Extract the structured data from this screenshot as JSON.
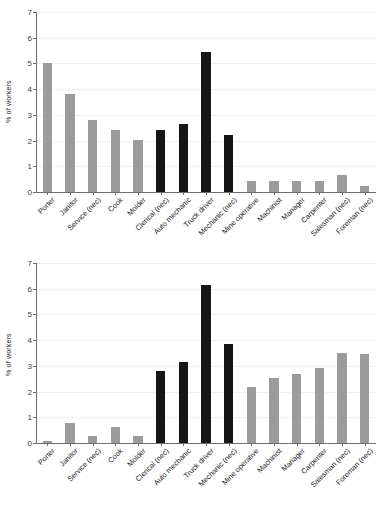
{
  "figure": {
    "background_color": "#ffffff",
    "bar_color_gray": "#9b9b9b",
    "bar_color_black": "#161616",
    "axis_color": "#6d6e71",
    "grid_color": "#f0f0f0"
  },
  "chart_data": [
    {
      "type": "bar",
      "title": "",
      "xlabel": "",
      "ylabel": "% of workers",
      "ylim": [
        0,
        7
      ],
      "yticks": [
        0,
        1,
        2,
        3,
        4,
        5,
        6,
        7
      ],
      "ytick_labels": [
        "0",
        "1",
        "2",
        "3",
        "4",
        "5",
        "6",
        "7"
      ],
      "grid": true,
      "legend": "none",
      "categories": [
        "Porter",
        "Janitor",
        "Service (nec)",
        "Cook",
        "Molder",
        "Clerical (nec)",
        "Auto mechanic",
        "Truck driver",
        "Mechanic (nec)",
        "Mine operative",
        "Machinist",
        "Manager",
        "Carpenter",
        "Salesman (nec)",
        "Foreman (nec)"
      ],
      "values": [
        5.0,
        3.82,
        2.81,
        2.4,
        2.02,
        2.41,
        2.63,
        5.44,
        2.23,
        0.43,
        0.43,
        0.43,
        0.44,
        0.65,
        0.24
      ],
      "bar_colors": [
        "#9b9b9b",
        "#9b9b9b",
        "#9b9b9b",
        "#9b9b9b",
        "#9b9b9b",
        "#161616",
        "#161616",
        "#161616",
        "#161616",
        "#9b9b9b",
        "#9b9b9b",
        "#9b9b9b",
        "#9b9b9b",
        "#9b9b9b",
        "#9b9b9b"
      ]
    },
    {
      "type": "bar",
      "title": "",
      "xlabel": "",
      "ylabel": "% of workers",
      "ylim": [
        0,
        7
      ],
      "yticks": [
        0,
        1,
        2,
        3,
        4,
        5,
        6,
        7
      ],
      "ytick_labels": [
        "0",
        "1",
        "2",
        "3",
        "4",
        "5",
        "6",
        "7"
      ],
      "grid": true,
      "legend": "none",
      "categories": [
        "Porter",
        "Janitor",
        "Service (nec)",
        "Cook",
        "Molder",
        "Clerical (nec)",
        "Auto mechanic",
        "Truck driver",
        "Mechanic (nec)",
        "Mine operative",
        "Machinist",
        "Manager",
        "Carpenter",
        "Salesman (nec)",
        "Foreman (nec)"
      ],
      "values": [
        0.09,
        0.77,
        0.28,
        0.63,
        0.26,
        2.81,
        3.14,
        6.15,
        3.85,
        2.17,
        2.53,
        2.67,
        2.93,
        3.49,
        3.45
      ],
      "bar_colors": [
        "#9b9b9b",
        "#9b9b9b",
        "#9b9b9b",
        "#9b9b9b",
        "#9b9b9b",
        "#161616",
        "#161616",
        "#161616",
        "#161616",
        "#9b9b9b",
        "#9b9b9b",
        "#9b9b9b",
        "#9b9b9b",
        "#9b9b9b",
        "#9b9b9b"
      ]
    }
  ]
}
